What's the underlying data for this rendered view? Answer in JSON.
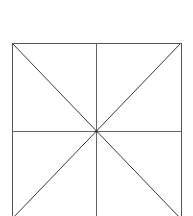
{
  "figure": {
    "canvas": {
      "width": 193,
      "height": 216,
      "background_color": "#ffffff"
    },
    "square": {
      "left": 12,
      "top": 43,
      "right": 181,
      "bottom": 219,
      "width": 169,
      "height": 176,
      "clipped_edge": "bottom"
    },
    "center_point": {
      "x": 96,
      "y": 131,
      "label": "center"
    },
    "colors": {
      "border": "#555555",
      "median": "#666666",
      "diagonal": "#3a3a3a",
      "background": "#ffffff"
    },
    "stroke_widths": {
      "border": 1,
      "median": 1,
      "diagonal": 1
    },
    "segments": [
      {
        "name": "top-edge",
        "kind": "edge",
        "x1": 12,
        "y1": 43,
        "x2": 181,
        "y2": 43
      },
      {
        "name": "left-edge",
        "kind": "edge",
        "x1": 12,
        "y1": 43,
        "x2": 12,
        "y2": 219
      },
      {
        "name": "right-edge",
        "kind": "edge",
        "x1": 181,
        "y1": 43,
        "x2": 181,
        "y2": 219
      },
      {
        "name": "bottom-edge",
        "kind": "edge",
        "x1": 12,
        "y1": 219,
        "x2": 181,
        "y2": 219
      },
      {
        "name": "horizontal-median",
        "kind": "median",
        "x1": 12,
        "y1": 131,
        "x2": 181,
        "y2": 131
      },
      {
        "name": "vertical-median",
        "kind": "median",
        "x1": 96,
        "y1": 43,
        "x2": 96,
        "y2": 219
      },
      {
        "name": "diagonal-tl-br",
        "kind": "diagonal",
        "x1": 12,
        "y1": 43,
        "x2": 181,
        "y2": 219
      },
      {
        "name": "diagonal-tr-bl",
        "kind": "diagonal",
        "x1": 181,
        "y1": 43,
        "x2": 12,
        "y2": 219
      }
    ]
  }
}
